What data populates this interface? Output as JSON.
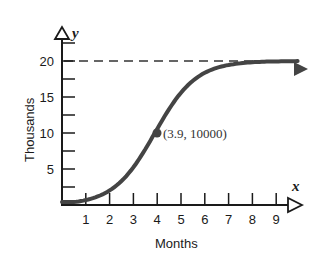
{
  "chart_data": {
    "type": "line",
    "title": "",
    "xlabel": "Months",
    "ylabel": "Thousands",
    "x_axis_variable": "x",
    "y_axis_variable": "y",
    "x_ticks": [
      "1",
      "2",
      "3",
      "4",
      "5",
      "6",
      "7",
      "8",
      "9"
    ],
    "y_ticks": [
      "5",
      "10",
      "15",
      "20"
    ],
    "xlim": [
      0,
      10
    ],
    "ylim": [
      0,
      22
    ],
    "grid": false,
    "asymptote": {
      "y": 20,
      "style": "dashed",
      "label": ""
    },
    "series": [
      {
        "name": "logistic growth",
        "x": [
          0,
          1,
          2,
          3,
          3.5,
          3.9,
          4.5,
          5,
          6,
          7,
          8,
          9,
          10
        ],
        "values": [
          0.4,
          0.9,
          2.0,
          4.8,
          7.2,
          10.0,
          13.8,
          15.8,
          17.8,
          18.6,
          18.9,
          19.0,
          19.1
        ]
      }
    ],
    "annotations": [
      {
        "x": 3.9,
        "y": 10000,
        "text": "(3.9, 10000)",
        "marker": "filled-circle"
      }
    ]
  },
  "labels": {
    "xlabel": "Months",
    "ylabel": "Thousands",
    "x_var": "x",
    "y_var": "y",
    "point_label": "(3.9, 10000)"
  }
}
